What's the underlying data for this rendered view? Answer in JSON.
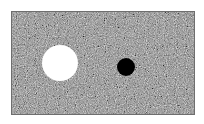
{
  "figure": {
    "background_color": "#ffffff",
    "panel": {
      "x": 11,
      "y": 11,
      "width": 184,
      "height": 104,
      "texture": "gray-noise",
      "border_color": "#6e6e6e"
    },
    "shapes": [
      {
        "type": "circle",
        "name": "white-circle",
        "cx": 59,
        "cy": 62,
        "r": 18,
        "fill": "#ffffff"
      },
      {
        "type": "circle",
        "name": "black-circle",
        "cx": 125,
        "cy": 66,
        "r": 9,
        "fill": "#000000"
      }
    ]
  }
}
